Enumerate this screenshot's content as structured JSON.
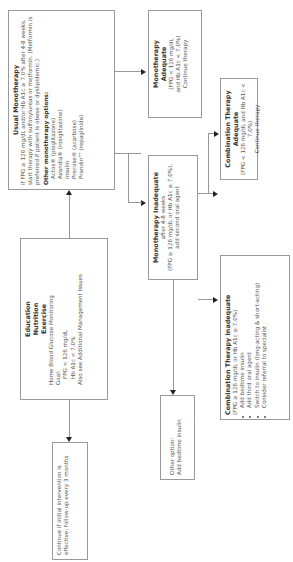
{
  "education": {
    "title1": "Education",
    "title2": "Nutrition",
    "title3": "Exercise",
    "line1": "Home Blood Glucose Monitoring",
    "goal": "Goal:",
    "goal1": "FPG < 126 mg/dL",
    "goal2": "Hb A1c < 7.0%",
    "also": "Also see Additional Management Issues"
  },
  "continue_box": {
    "text": "Continue if initial intervention is effective; follow-up every 3 months"
  },
  "usual_mono": {
    "title": "Usual Monotherapy",
    "text": "If FPG ≥ 126 mg/dL and/or Hb A1c ≥ 7.0% after 4-8 weeks, start therapy with sulfonylureas or metformin. (Metformin is preferred if patient is obese or dyslipidemic.)",
    "other_title": "Other monotherapy options:",
    "options": [
      "Actos® (pioglitazone)",
      "Avandia® (rosiglitazone)",
      "Insulin",
      "Precose® (acarbose)",
      "Prandin™ (repaglinide)"
    ]
  },
  "mono_adequate": {
    "title1": "Monotherapy",
    "title2": "Adequate",
    "line1": "(FPG < 126 mg/dL",
    "line2": "and Hb A1c < 7.0%)",
    "line3": "Continue therapy"
  },
  "mono_inadequate": {
    "title": "Monotherapy Inadequate",
    "line1": "after 4-8 weeks",
    "line2": "(FPG ≥ 126 mg/dL or Hb A1c ≥ 7.0%),",
    "line3": "add second oral agent"
  },
  "combo_adequate": {
    "title": "Combination Therapy Adequate",
    "line1": "(FPG < 126 mg/dL and Hb A1c < 7.0%)",
    "line2": "Continue therapy"
  },
  "other_option": {
    "line1": "Other option:",
    "line2": "Add bedtime insulin"
  },
  "combo_inadequate": {
    "title": "Combination Therapy Inadequate",
    "line1": "(FPG ≥ 126 mg/dL or Hb A1c ≥ 7.0%)",
    "bullets": [
      "Add bedtime insulin",
      "Add third oral agent",
      "Switch to insulin (long-acting & short-acting)",
      "Consider referral to specialist"
    ]
  }
}
